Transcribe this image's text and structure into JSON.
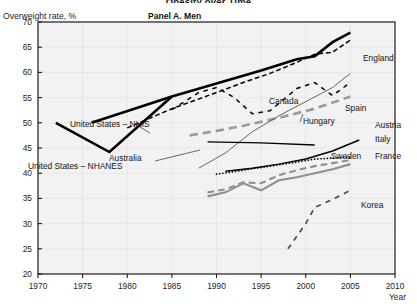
{
  "figure": {
    "clipped_top_title": "Obesity over Time",
    "y_axis_title": "Overweight rate, %",
    "panel_title": "Panel A. Men",
    "x_axis_title": "Year"
  },
  "chart_data": {
    "type": "line",
    "title": "Panel A. Men",
    "xlabel": "Year",
    "ylabel": "Overweight rate, %",
    "xlim": [
      1970,
      2010
    ],
    "ylim": [
      20,
      70
    ],
    "xticks": [
      1970,
      1975,
      1980,
      1985,
      1990,
      1995,
      2000,
      2005,
      2010
    ],
    "yticks": [
      20,
      25,
      30,
      35,
      40,
      45,
      50,
      55,
      60,
      65,
      70
    ],
    "grid": true,
    "legend": "inline-labels",
    "series": [
      {
        "name": "United States – NHIS",
        "label": "United States – NHIS",
        "color": "#000000",
        "style": "solid",
        "width": 2.6,
        "x": [
          1976,
          1985,
          1990,
          1995,
          1999,
          2001,
          2003,
          2005
        ],
        "y": [
          50.0,
          55.2,
          57.8,
          60.4,
          62.6,
          63.2,
          66.0,
          67.9
        ]
      },
      {
        "name": "United States – NHANES",
        "label": "United States – NHANES",
        "color": "#000000",
        "style": "solid",
        "width": 2.6,
        "x": [
          1972,
          1978,
          1985
        ],
        "y": [
          50.0,
          44.2,
          55.2
        ]
      },
      {
        "name": "England",
        "label": "England",
        "color": "#000000",
        "style": "dashed",
        "width": 1.5,
        "x": [
          1980,
          1985,
          1990,
          1993,
          1996,
          1999,
          2001,
          2003,
          2005
        ],
        "y": [
          49.0,
          52.8,
          56.0,
          58.0,
          59.8,
          62.0,
          63.6,
          64.0,
          66.4
        ]
      },
      {
        "name": "Canada",
        "label": "Canada",
        "color": "#000000",
        "style": "dashdot",
        "width": 1.5,
        "x": [
          1985,
          1988,
          1990,
          1992,
          1994,
          1996,
          1999,
          2001,
          2003,
          2005
        ],
        "y": [
          52.6,
          56.0,
          57.0,
          55.0,
          51.8,
          52.4,
          56.8,
          58.0,
          55.4,
          58.0
        ]
      },
      {
        "name": "Spain",
        "label": "Spain",
        "color": "#9a9a9a",
        "style": "dashed",
        "width": 2.6,
        "x": [
          1987,
          1990,
          1993,
          1995,
          1997,
          2001,
          2003,
          2005
        ],
        "y": [
          47.5,
          48.4,
          49.4,
          50.2,
          51.0,
          52.8,
          54.0,
          55.2
        ]
      },
      {
        "name": "Hungary",
        "label": "Hungary",
        "color": "#555555",
        "style": "solid",
        "width": 0.9,
        "x": [
          1988,
          1991,
          1994,
          1997,
          2000,
          2003,
          2005
        ],
        "y": [
          41.0,
          44.0,
          48.2,
          51.4,
          54.2,
          57.0,
          59.8
        ]
      },
      {
        "name": "Australia",
        "label": "Australia",
        "color": "#000000",
        "style": "solid",
        "width": 1.3,
        "x": [
          1989,
          1995,
          2001
        ],
        "y": [
          46.2,
          46.0,
          45.6
        ]
      },
      {
        "name": "Austria",
        "label": "Austria",
        "color": "#000000",
        "style": "solid",
        "width": 1.5,
        "x": [
          1991,
          1994,
          1997,
          2000,
          2003,
          2006
        ],
        "y": [
          40.4,
          41.0,
          41.8,
          42.8,
          44.4,
          46.6
        ]
      },
      {
        "name": "Italy",
        "label": "Italy",
        "color": "#000000",
        "style": "dotted",
        "width": 1.7,
        "x": [
          1990,
          1993,
          1996,
          1999,
          2001,
          2003,
          2005
        ],
        "y": [
          39.8,
          40.6,
          41.4,
          42.2,
          42.8,
          43.0,
          43.2
        ]
      },
      {
        "name": "Sweden",
        "label": "Sweden",
        "color": "#8f8f8f",
        "style": "dashed",
        "width": 2.1,
        "x": [
          1989,
          1991,
          1993,
          1995,
          1997,
          1999,
          2001,
          2003,
          2005
        ],
        "y": [
          36.2,
          36.8,
          38.2,
          38.0,
          39.6,
          40.6,
          41.4,
          42.0,
          42.6
        ]
      },
      {
        "name": "France",
        "label": "France",
        "color": "#8f8f8f",
        "style": "solid",
        "width": 2.1,
        "x": [
          1989,
          1991,
          1993,
          1995,
          1997,
          1999,
          2001,
          2003,
          2005
        ],
        "y": [
          35.4,
          36.2,
          38.0,
          36.6,
          38.6,
          39.2,
          40.0,
          40.8,
          41.8
        ]
      },
      {
        "name": "Korea",
        "label": "Korea",
        "color": "#4a4a4a",
        "style": "dashdot",
        "width": 1.7,
        "x": [
          1998,
          2000,
          2001,
          2003,
          2005
        ],
        "y": [
          25.0,
          30.0,
          33.2,
          34.8,
          36.6
        ]
      }
    ],
    "annotations": [
      {
        "text": "United States – NHIS",
        "x": 70,
        "y": 127
      },
      {
        "text": "United States – NHANES",
        "x": 28,
        "y": 169
      },
      {
        "text": "Australia",
        "x": 109,
        "y": 161
      },
      {
        "text": "Canada",
        "x": 269,
        "y": 104
      },
      {
        "text": "Spain",
        "x": 345,
        "y": 111
      },
      {
        "text": "Hungary",
        "x": 303,
        "y": 124
      },
      {
        "text": "England",
        "x": 363,
        "y": 61
      },
      {
        "text": "Austria",
        "x": 375,
        "y": 128
      },
      {
        "text": "Italy",
        "x": 375,
        "y": 142
      },
      {
        "text": "Sweden",
        "x": 331,
        "y": 159
      },
      {
        "text": "France",
        "x": 375,
        "y": 159
      },
      {
        "text": "Korea",
        "x": 361,
        "y": 208
      }
    ]
  }
}
